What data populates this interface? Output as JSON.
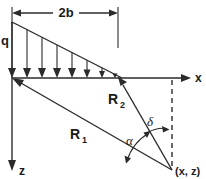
{
  "diagram": {
    "background_color": "#ffffff",
    "line_color": "#2b2b2b",
    "labels": {
      "load_intensity": "q",
      "width": "2b",
      "axis_x": "x",
      "axis_z": "z",
      "radius_far": "R",
      "radius_far_sub": "1",
      "radius_near": "R",
      "radius_near_sub": "2",
      "angle_alpha": "α",
      "angle_delta": "δ",
      "point": "(x, z)"
    },
    "geometry": {
      "origin": {
        "x": 12,
        "y": 78
      },
      "load_right_edge_x": 118,
      "load_apex": {
        "x": 12,
        "y": 22
      },
      "x_axis_end": {
        "x": 190,
        "y": 78
      },
      "z_axis_end": {
        "x": 12,
        "y": 170
      },
      "field_point": {
        "x": 172,
        "y": 170
      },
      "dimension_line_y": 13,
      "load_arrow_count": 8
    },
    "icons": {
      "arrow_head": "triangle-arrowhead",
      "dashed_line": "dashed-projection-line"
    }
  }
}
